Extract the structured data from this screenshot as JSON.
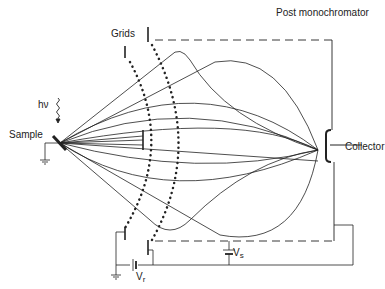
{
  "labels": {
    "post_monochromator": "Post monochromator",
    "grids": "Grids",
    "hv": "hν",
    "sample": "Sample",
    "collector": "Collector",
    "vs_main": "V",
    "vs_sub": "s",
    "vr_main": "V",
    "vr_sub": "r"
  },
  "colors": {
    "ink": "#222222",
    "background": "#ffffff"
  }
}
